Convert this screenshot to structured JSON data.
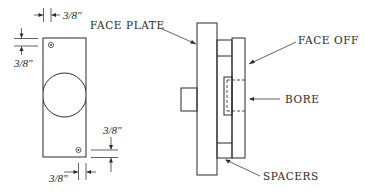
{
  "diagram": {
    "front_view": {
      "dimensions": {
        "top_edge_offset": "3/8\"",
        "left_edge_offset": "3/8\"",
        "bottom_edge_offset": "3/8\"",
        "right_edge_offset": "3/8\""
      }
    },
    "side_view": {
      "labels": {
        "face_plate": "FACE PLATE",
        "face_off": "FACE OFF",
        "bore": "BORE",
        "spacers": "SPACERS"
      }
    },
    "colors": {
      "ink": "#2a2a2a",
      "background": "#ffffff"
    }
  }
}
